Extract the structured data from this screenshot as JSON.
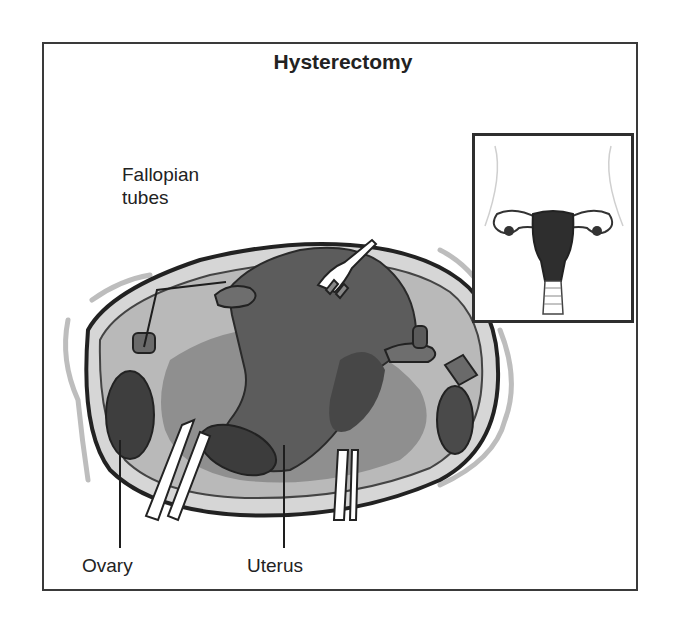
{
  "figure": {
    "title": "Hysterectomy",
    "labels": {
      "fallopian_tubes": "Fallopian\ntubes",
      "fallopian_line1": "Fallopian",
      "fallopian_line2": "tubes",
      "ovary": "Ovary",
      "uterus": "Uterus"
    },
    "inset": {
      "description": "uterus-with-ovaries-and-fallopian-tubes-front-view"
    },
    "colors": {
      "frame": "#3a3a3a",
      "uterus": "#5e5e5e",
      "tissue_light": "#c8c8c8",
      "tissue_mid": "#9a9a9a",
      "organ_dark": "#3c3c3c",
      "outline": "#222222"
    }
  }
}
